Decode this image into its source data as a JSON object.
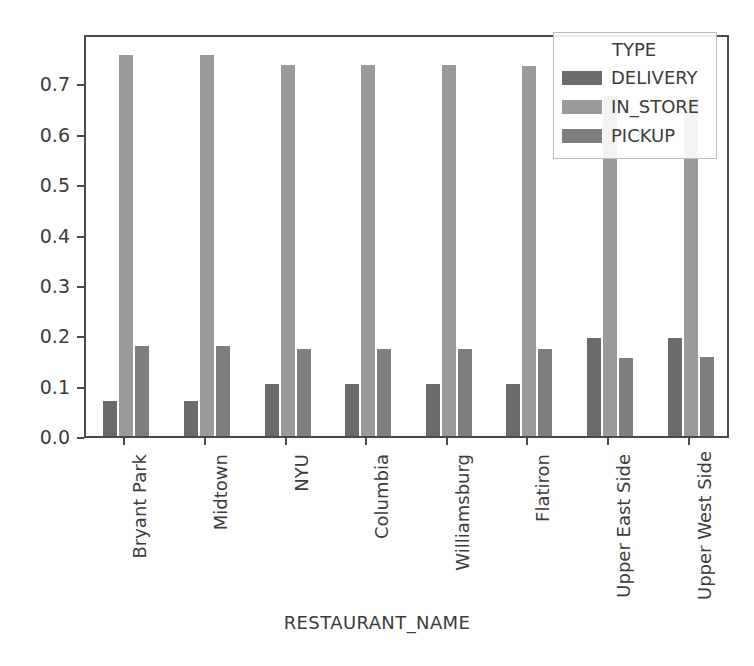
{
  "chart_data": {
    "type": "bar",
    "title": "",
    "subtitle": "",
    "xlabel": "RESTAURANT_NAME",
    "ylabel": "",
    "categories": [
      "Bryant Park",
      "Midtown",
      "NYU",
      "Columbia",
      "Williamsburg",
      "Flatiron",
      "Upper East Side",
      "Upper West Side"
    ],
    "series": [
      {
        "name": "DELIVERY",
        "color": "#6b6b6b",
        "values": [
          0.07,
          0.07,
          0.103,
          0.103,
          0.103,
          0.103,
          0.195,
          0.195
        ]
      },
      {
        "name": "IN_STORE",
        "color": "#9a9a9a",
        "values": [
          0.757,
          0.757,
          0.737,
          0.736,
          0.736,
          0.734,
          0.675,
          0.672
        ]
      },
      {
        "name": "PICKUP",
        "color": "#7e7e7e",
        "values": [
          0.178,
          0.178,
          0.173,
          0.172,
          0.172,
          0.172,
          0.155,
          0.157
        ]
      }
    ],
    "ylim": [
      0.0,
      0.8
    ],
    "yticks": [
      0.0,
      0.1,
      0.2,
      0.3,
      0.4,
      0.5,
      0.6,
      0.7
    ],
    "ytick_labels": [
      "0.0",
      "0.1",
      "0.2",
      "0.3",
      "0.4",
      "0.5",
      "0.6",
      "0.7"
    ],
    "grid": false,
    "legend_position": "upper right",
    "legend_title": "TYPE",
    "frame_color": "#4a4a4a"
  },
  "legend": {
    "title": "TYPE",
    "entries": [
      {
        "label": "DELIVERY",
        "color": "#6b6b6b"
      },
      {
        "label": "IN_STORE",
        "color": "#9a9a9a"
      },
      {
        "label": "PICKUP",
        "color": "#7e7e7e"
      }
    ]
  },
  "axes": {
    "x_title": "RESTAURANT_NAME"
  }
}
